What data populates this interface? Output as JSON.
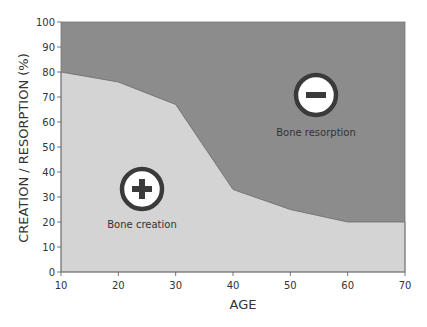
{
  "chart_data": {
    "type": "area",
    "title": "",
    "xlabel": "AGE",
    "ylabel": "CREATION / RESORPTION (%)",
    "xlim": [
      10,
      70
    ],
    "ylim": [
      0,
      100
    ],
    "x_ticks": [
      10,
      20,
      30,
      40,
      50,
      60,
      70
    ],
    "y_ticks": [
      0,
      10,
      20,
      30,
      40,
      50,
      60,
      70,
      80,
      90,
      100
    ],
    "grid": false,
    "x": [
      10,
      20,
      30,
      40,
      50,
      60,
      70
    ],
    "series": [
      {
        "name": "Bone creation",
        "values": [
          80,
          76,
          67,
          33,
          25,
          20,
          20
        ],
        "color": "#d4d4d4"
      },
      {
        "name": "Bone resorption",
        "values": [
          20,
          24,
          33,
          67,
          75,
          80,
          80
        ],
        "color": "#8c8c8c"
      }
    ],
    "annotations": [
      {
        "text": "Bone creation",
        "icon": "plus-icon",
        "x": 24,
        "y": 28
      },
      {
        "text": "Bone resorption",
        "icon": "minus-icon",
        "x": 55,
        "y": 68
      }
    ]
  },
  "labels": {
    "creation": "Bone creation",
    "resorption": "Bone resorption",
    "xlabel": "AGE",
    "ylabel": "CREATION / RESORPTION (%)"
  }
}
